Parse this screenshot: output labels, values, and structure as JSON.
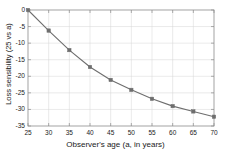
{
  "chart_data": {
    "type": "line",
    "title": "",
    "xlabel": "Observer's age (a, in years)",
    "ylabel": "Loss sensibility (25 vs a)",
    "x": [
      25,
      30,
      35,
      40,
      45,
      50,
      55,
      60,
      65,
      70
    ],
    "values": [
      0,
      -6.2,
      -12.1,
      -17.2,
      -21.1,
      -24.1,
      -26.8,
      -29.0,
      -30.6,
      -32.2
    ],
    "series": [
      {
        "name": "Loss sensibility",
        "values": [
          0,
          -6.2,
          -12.1,
          -17.2,
          -21.1,
          -24.1,
          -26.8,
          -29.0,
          -30.6,
          -32.2
        ]
      }
    ],
    "xlim": [
      25,
      70
    ],
    "ylim": [
      -35,
      0
    ],
    "xticks": [
      25,
      30,
      35,
      40,
      45,
      50,
      55,
      60,
      65,
      70
    ],
    "yticks": [
      0,
      -5,
      -10,
      -15,
      -20,
      -25,
      -30,
      -35
    ],
    "xtick_labels": [
      "25",
      "30",
      "35",
      "40",
      "45",
      "50",
      "55",
      "60",
      "65",
      "70"
    ],
    "ytick_labels": [
      "0",
      "-5",
      "-10",
      "-15",
      "-20",
      "-25",
      "-30",
      "-35"
    ],
    "grid": true,
    "legend": false,
    "legend_position": "none",
    "line_color": "#6e6e6e",
    "marker": "square",
    "marker_color": "#6e6e6e",
    "grid_color": "#d4d4d4",
    "axis_color": "#8c8c8c",
    "background_color": "#ffffff"
  }
}
